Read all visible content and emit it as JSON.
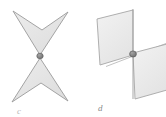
{
  "figure": {
    "background_color": "#ffffff",
    "panels": [
      {
        "id": "c",
        "label": "c",
        "description": "Two dart (concave quadrilateral) shapes meeting tip to tip at a single shared point",
        "shapes": [
          {
            "name": "upper-dart",
            "fill": "#e3e3e3",
            "stroke": "#9a9a9a",
            "points": "13,11 42,30 68,12 40,55"
          },
          {
            "name": "lower-dart",
            "fill": "#e3e3e3",
            "stroke": "#9a9a9a",
            "points": "40,58 68,101 41,83 12,102"
          }
        ],
        "intersection_point": {
          "name": "shared-vertex",
          "x": 40,
          "y": 56,
          "rx": 3.2,
          "ry": 2.6,
          "fill": "#8a8a8a",
          "stroke": "#6f6f6f"
        }
      },
      {
        "id": "d",
        "label": "d",
        "description": "Two parallelogram planes in oblique projection intersecting at a marked point",
        "shapes": [
          {
            "name": "upper-left-plane",
            "fill": "#ececec",
            "stroke": "#a6a6a6",
            "points": "97,19 133,10 133,55 100,65"
          },
          {
            "name": "lower-right-plane",
            "fill": "#ececec",
            "stroke": "#a6a6a6",
            "points": "133,53 167,44 167,90 135,99"
          }
        ],
        "axis_line": {
          "name": "vertical-axis",
          "x1": 133,
          "y1": 8,
          "x2": 133,
          "y2": 100,
          "stroke": "#9d9d9d"
        },
        "cross_line": {
          "name": "oblique-axis",
          "x1": 108,
          "y1": 66,
          "x2": 166,
          "y2": 44,
          "stroke": "#adadad"
        },
        "intersection_point": {
          "name": "plane-intersection-point",
          "x": 133,
          "y": 54,
          "rx": 3.4,
          "ry": 3.0,
          "fill": "#7f7f7f",
          "stroke": "#5f5f5f"
        }
      }
    ],
    "colors": {
      "shape_fill": "#e6e6e6",
      "shape_stroke": "#9e9e9e",
      "point_fill": "#848484",
      "label_text": "#8e8e8e",
      "background": "#ffffff"
    }
  }
}
